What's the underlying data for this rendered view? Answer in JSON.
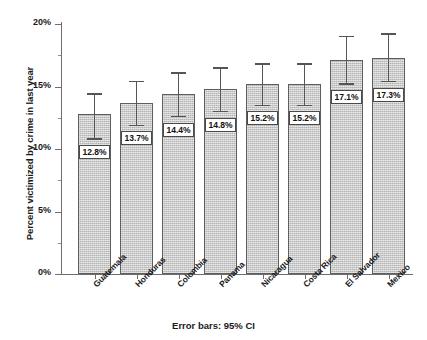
{
  "chart_data": {
    "type": "bar",
    "title": "",
    "subtitle": "",
    "xlabel": "",
    "ylabel": "Percent victimized by crime in last year",
    "footnote": "Error bars: 95% CI",
    "ylim": [
      0,
      20
    ],
    "ytick_values": [
      0,
      5,
      10,
      15,
      20
    ],
    "ytick_labels": [
      "0%",
      "5%",
      "10%",
      "15%",
      "20%"
    ],
    "grid": false,
    "legend": "none",
    "error_bar_type": "95% CI",
    "categories": [
      "Guatemala",
      "Honduras",
      "Colombia",
      "Panama",
      "Nicaragua",
      "Costa Rica",
      "El Salvador",
      "Mexico"
    ],
    "values": [
      12.8,
      13.7,
      14.4,
      14.8,
      15.2,
      15.2,
      17.1,
      17.3
    ],
    "value_labels": [
      "12.8%",
      "13.7%",
      "14.4%",
      "14.8%",
      "15.2%",
      "15.2%",
      "17.1%",
      "17.3%"
    ],
    "ci_lower": [
      10.8,
      11.9,
      12.6,
      13.0,
      13.5,
      13.5,
      15.2,
      15.4
    ],
    "ci_upper": [
      14.4,
      15.4,
      16.1,
      16.5,
      16.8,
      16.8,
      19.0,
      19.2
    ],
    "bar_color": "#c6c6c6",
    "bar_border_color": "#5e5e5e",
    "error_bar_color": "#555555",
    "axis_color": "#6e6e6e",
    "text_color": "#1a1a1a",
    "background_color": "#ffffff"
  }
}
